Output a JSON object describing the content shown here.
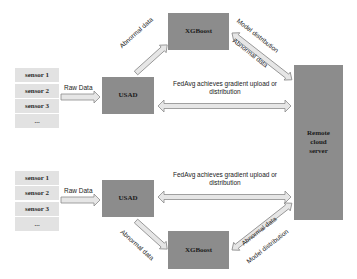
{
  "diagram": {
    "top_group": {
      "sensors": [
        "sensor 1",
        "sensor 2",
        "sensor 3",
        "..."
      ],
      "raw_data_label": "Raw Data",
      "usad_label": "USAD",
      "xgboost_label": "XGBoost",
      "usad_to_xgboost_label": "Abnormal data",
      "xgboost_cloud_labels": [
        "Model distribution",
        "Abnormal data"
      ],
      "fedavg_label_line1": "FedAvg achieves gradient upload or",
      "fedavg_label_line2": "distribution"
    },
    "bottom_group": {
      "sensors": [
        "sensor 1",
        "sensor 2",
        "sensor 3",
        "..."
      ],
      "raw_data_label": "Raw Data",
      "usad_label": "USAD",
      "xgboost_label": "XGBoost",
      "usad_to_xgboost_label": "Abnormal data",
      "xgboost_cloud_labels": [
        "Abnormal data",
        "Model distribution"
      ],
      "fedavg_label_line1": "FedAvg achieves gradient upload or",
      "fedavg_label_line2": "distribution"
    },
    "cloud": {
      "line1": "Remote",
      "line2": "cloud",
      "line3": "server"
    },
    "colors": {
      "box_fill": "#8c8c8c",
      "sensor_fill": "#e2e2e2",
      "arrow_fill": "#e6e6e6",
      "arrow_stroke": "#8a8a8a"
    }
  }
}
